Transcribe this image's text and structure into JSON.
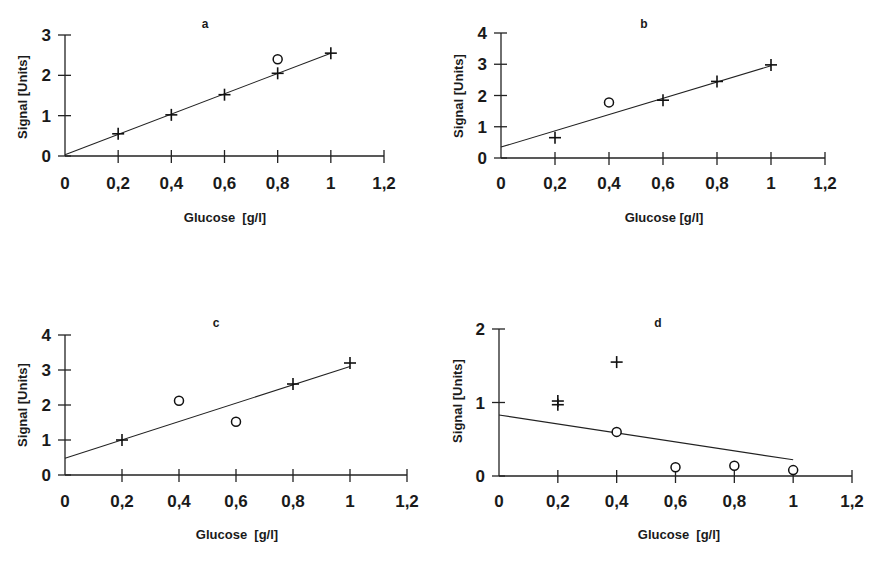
{
  "chart_data": [
    {
      "type": "scatter",
      "title": "a",
      "xlabel": "Glucose  [g/l]",
      "ylabel": "Signal [Units]",
      "xlim": [
        0,
        1.2
      ],
      "ylim": [
        0,
        3
      ],
      "x_ticks": [
        "0",
        "0,2",
        "0,4",
        "0,6",
        "0,8",
        "1",
        "1,2"
      ],
      "y_ticks": [
        "0",
        "1",
        "2",
        "3"
      ],
      "grid": false,
      "series": [
        {
          "name": "included (+)",
          "marker": "plus",
          "points": [
            [
              0.2,
              0.55
            ],
            [
              0.4,
              1.02
            ],
            [
              0.6,
              1.52
            ],
            [
              0.8,
              2.05
            ],
            [
              1.0,
              2.55
            ]
          ]
        },
        {
          "name": "outlier (o)",
          "marker": "circle",
          "points": [
            [
              0.8,
              2.4
            ]
          ]
        }
      ],
      "fit_line": {
        "from": [
          0,
          0.03
        ],
        "to": [
          1.0,
          2.55
        ]
      }
    },
    {
      "type": "scatter",
      "title": "b",
      "xlabel": "Glucose [g/l]",
      "ylabel": "Signal [Units]",
      "xlim": [
        0,
        1.2
      ],
      "ylim": [
        0,
        4
      ],
      "x_ticks": [
        "0",
        "0,2",
        "0,4",
        "0,6",
        "0,8",
        "1",
        "1,2"
      ],
      "y_ticks": [
        "0",
        "1",
        "2",
        "3",
        "4"
      ],
      "grid": false,
      "series": [
        {
          "name": "included (+)",
          "marker": "plus",
          "points": [
            [
              0.2,
              0.65
            ],
            [
              0.6,
              1.85
            ],
            [
              0.8,
              2.45
            ],
            [
              1.0,
              2.98
            ]
          ]
        },
        {
          "name": "outlier (o)",
          "marker": "circle",
          "points": [
            [
              0.4,
              1.78
            ]
          ]
        }
      ],
      "fit_line": {
        "from": [
          0,
          0.35
        ],
        "to": [
          1.0,
          2.95
        ]
      }
    },
    {
      "type": "scatter",
      "title": "c",
      "xlabel": "Glucose  [g/l]",
      "ylabel": "Signal [Units]",
      "xlim": [
        0,
        1.2
      ],
      "ylim": [
        0,
        4
      ],
      "x_ticks": [
        "0",
        "0,2",
        "0,4",
        "0,6",
        "0,8",
        "1",
        "1,2"
      ],
      "y_ticks": [
        "0",
        "1",
        "2",
        "3",
        "4"
      ],
      "grid": false,
      "series": [
        {
          "name": "included (+)",
          "marker": "plus",
          "points": [
            [
              0.2,
              1.0
            ],
            [
              0.8,
              2.6
            ],
            [
              1.0,
              3.2
            ]
          ]
        },
        {
          "name": "outlier (o)",
          "marker": "circle",
          "points": [
            [
              0.4,
              2.12
            ],
            [
              0.6,
              1.52
            ]
          ]
        }
      ],
      "fit_line": {
        "from": [
          0,
          0.48
        ],
        "to": [
          1.0,
          3.1
        ]
      }
    },
    {
      "type": "scatter",
      "title": "d",
      "xlabel": "Glucose  [g/l]",
      "ylabel": "Signal [Units]",
      "xlim": [
        0,
        1.2
      ],
      "ylim": [
        0,
        2
      ],
      "x_ticks": [
        "0",
        "0,2",
        "0,4",
        "0,6",
        "0,8",
        "1",
        "1,2"
      ],
      "y_ticks": [
        "0",
        "1",
        "2"
      ],
      "grid": false,
      "series": [
        {
          "name": "excluded (+)",
          "marker": "plus",
          "points": [
            [
              0.2,
              0.97
            ],
            [
              0.2,
              1.02
            ],
            [
              0.4,
              1.55
            ]
          ]
        },
        {
          "name": "included (o)",
          "marker": "circle",
          "points": [
            [
              0.4,
              0.6
            ],
            [
              0.6,
              0.12
            ],
            [
              0.8,
              0.14
            ],
            [
              1.0,
              0.08
            ]
          ]
        }
      ],
      "fit_line": {
        "from": [
          0,
          0.83
        ],
        "to": [
          1.0,
          0.22
        ]
      }
    }
  ],
  "panels": [
    {
      "title": "a",
      "xlabel": "Glucose  [g/l]",
      "ylabel": "Signal [Units]"
    },
    {
      "title": "b",
      "xlabel": "Glucose [g/l]",
      "ylabel": "Signal [Units]"
    },
    {
      "title": "c",
      "xlabel": "Glucose  [g/l]",
      "ylabel": "Signal [Units]"
    },
    {
      "title": "d",
      "xlabel": "Glucose  [g/l]",
      "ylabel": "Signal [Units]"
    }
  ]
}
